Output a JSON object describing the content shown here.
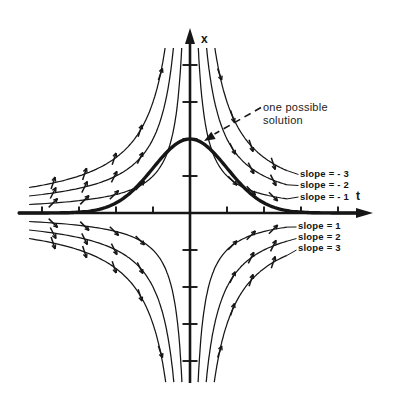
{
  "figure": {
    "x_axis_label": "x",
    "t_axis_label": "t",
    "solution_annotation": {
      "line1": "one possible",
      "line2": "solution"
    },
    "isocline_labels": [
      {
        "slope": -3,
        "text": "slope = - 3"
      },
      {
        "slope": -2,
        "text": "slope = - 2"
      },
      {
        "slope": -1,
        "text": "slope = - 1"
      },
      {
        "slope": 1,
        "text": "slope = 1"
      },
      {
        "slope": 2,
        "text": "slope = 2"
      },
      {
        "slope": 3,
        "text": "slope = 3"
      }
    ]
  },
  "chart_data": {
    "type": "line",
    "xlabel": "t",
    "ylabel": "x",
    "t_range": [
      -4.65,
      4.9
    ],
    "x_range": [
      -4.7,
      5.0
    ],
    "grid": false,
    "tick_step": 1,
    "ticks_t": [
      -4,
      -3,
      -2,
      -1,
      1,
      2,
      3,
      4
    ],
    "ticks_x": [
      -4,
      -3,
      -2,
      -1,
      1,
      2,
      3,
      4
    ],
    "isocline_family": "x * t = constant (isoclines of dx/dt = -x t)",
    "isocline_k_values": [
      1,
      2,
      3
    ],
    "quadrants": [
      {
        "name": "upper-left",
        "t_sign": -1,
        "x_sign": 1,
        "slope_values": [
          1,
          2,
          3
        ]
      },
      {
        "name": "upper-right",
        "t_sign": 1,
        "x_sign": 1,
        "slope_values": [
          -1,
          -2,
          -3
        ]
      },
      {
        "name": "lower-left",
        "t_sign": -1,
        "x_sign": -1,
        "slope_values": [
          -1,
          -2,
          -3
        ]
      },
      {
        "name": "lower-right",
        "t_sign": 1,
        "x_sign": -1,
        "slope_values": [
          1,
          2,
          3
        ]
      }
    ],
    "labeled_isoclines": [
      {
        "label": "slope = - 3",
        "curve": "x = 3/t, t > 0"
      },
      {
        "label": "slope = - 2",
        "curve": "x = 2/t, t > 0"
      },
      {
        "label": "slope = - 1",
        "curve": "x = 1/t, t > 0"
      },
      {
        "label": "slope = 1",
        "curve": "x = -1/t, t > 0"
      },
      {
        "label": "slope = 2",
        "curve": "x = -2/t, t > 0"
      },
      {
        "label": "slope = 3",
        "curve": "x = -3/t, t > 0"
      }
    ],
    "arrow_t_positions": {
      "left": [
        3.7,
        2.85,
        2.05,
        1.35
      ],
      "right": [
        2.25,
        1.65,
        1.15
      ],
      "outer_extra": [
        0.8
      ]
    },
    "solution_curve": {
      "formula": "x(t) = 2 e^(-t^2/2)",
      "amplitude": 2,
      "peak": [
        0,
        2
      ],
      "annotation": "one possible solution"
    },
    "colors": {
      "ink": "#161616",
      "background": "#ffffff"
    }
  }
}
